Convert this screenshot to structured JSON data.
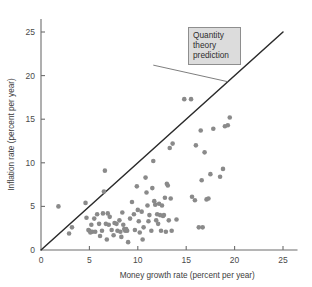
{
  "chart_data": {
    "type": "scatter",
    "title": "",
    "xlabel": "Money growth rate (percent per year)",
    "ylabel": "Inflation rate (percent per year)",
    "xlim": [
      0,
      26.5
    ],
    "ylim": [
      0,
      26.5
    ],
    "xticks": [
      0,
      5,
      10,
      15,
      20,
      25
    ],
    "yticks": [
      0,
      5,
      10,
      15,
      20,
      25
    ],
    "xticklabels": [
      "0",
      "5",
      "10",
      "15",
      "20",
      "25"
    ],
    "yticklabels": [
      "0",
      "5",
      "10",
      "15",
      "20",
      "25"
    ],
    "grid": false,
    "legend": false,
    "point_color": "#8a8a8a",
    "point_radius": 2.3,
    "reference_line": {
      "name": "Quantity theory prediction",
      "slope": 1,
      "intercept": 0,
      "x_start": 0,
      "x_end": 25,
      "color": "#2b2b2b"
    },
    "annotation": {
      "lines": [
        "Quantity",
        "theory",
        "prediction"
      ],
      "box_fill": "#dcdcdc",
      "box_border": "#8e8e8e",
      "leader_from_x": 11.6,
      "leader_from_y": 21.2,
      "leader_to_x": 19.3,
      "leader_to_y": 19.3
    },
    "points": [
      [
        1.8,
        5.0
      ],
      [
        2.9,
        1.9
      ],
      [
        3.2,
        2.6
      ],
      [
        4.6,
        5.4
      ],
      [
        4.7,
        3.7
      ],
      [
        4.9,
        2.3
      ],
      [
        5.0,
        2.2
      ],
      [
        5.1,
        2.0
      ],
      [
        5.2,
        2.9
      ],
      [
        5.3,
        2.1
      ],
      [
        5.5,
        3.6
      ],
      [
        5.6,
        2.1
      ],
      [
        5.8,
        4.1
      ],
      [
        6.0,
        3.0
      ],
      [
        6.1,
        1.6
      ],
      [
        6.3,
        2.2
      ],
      [
        6.4,
        4.2
      ],
      [
        6.5,
        6.7
      ],
      [
        6.6,
        9.1
      ],
      [
        6.7,
        3.0
      ],
      [
        6.8,
        1.2
      ],
      [
        6.9,
        4.2
      ],
      [
        7.0,
        2.9
      ],
      [
        7.1,
        3.8
      ],
      [
        7.3,
        2.3
      ],
      [
        7.5,
        1.7
      ],
      [
        7.6,
        3.1
      ],
      [
        7.8,
        3.0
      ],
      [
        7.9,
        2.2
      ],
      [
        8.1,
        3.4
      ],
      [
        8.2,
        2.1
      ],
      [
        8.3,
        1.5
      ],
      [
        8.4,
        4.3
      ],
      [
        8.5,
        2.9
      ],
      [
        8.6,
        2.4
      ],
      [
        8.7,
        2.2
      ],
      [
        8.8,
        2.4
      ],
      [
        8.9,
        2.2
      ],
      [
        9.0,
        0.9
      ],
      [
        9.2,
        3.6
      ],
      [
        9.4,
        5.5
      ],
      [
        9.6,
        4.1
      ],
      [
        9.7,
        2.3
      ],
      [
        9.9,
        7.3
      ],
      [
        10.0,
        4.6
      ],
      [
        10.1,
        3.3
      ],
      [
        10.2,
        2.0
      ],
      [
        10.4,
        4.4
      ],
      [
        10.5,
        1.2
      ],
      [
        10.6,
        2.6
      ],
      [
        10.8,
        8.3
      ],
      [
        10.9,
        6.6
      ],
      [
        11.0,
        5.1
      ],
      [
        11.1,
        3.3
      ],
      [
        11.2,
        4.0
      ],
      [
        11.4,
        2.2
      ],
      [
        11.5,
        7.1
      ],
      [
        11.6,
        10.2
      ],
      [
        11.7,
        5.6
      ],
      [
        11.8,
        5.2
      ],
      [
        11.9,
        3.4
      ],
      [
        12.0,
        4.1
      ],
      [
        12.1,
        3.0
      ],
      [
        12.2,
        5.3
      ],
      [
        12.3,
        4.0
      ],
      [
        12.4,
        2.2
      ],
      [
        12.5,
        5.1
      ],
      [
        12.6,
        3.9
      ],
      [
        12.7,
        4.0
      ],
      [
        12.8,
        6.0
      ],
      [
        12.9,
        2.1
      ],
      [
        13.0,
        7.6
      ],
      [
        13.1,
        7.4
      ],
      [
        13.2,
        3.4
      ],
      [
        13.3,
        11.7
      ],
      [
        13.4,
        5.9
      ],
      [
        13.5,
        2.2
      ],
      [
        13.6,
        12.2
      ],
      [
        14.0,
        3.5
      ],
      [
        14.8,
        17.3
      ],
      [
        15.5,
        17.3
      ],
      [
        15.6,
        6.1
      ],
      [
        15.9,
        5.7
      ],
      [
        16.0,
        12.0
      ],
      [
        16.3,
        2.6
      ],
      [
        16.5,
        13.7
      ],
      [
        16.6,
        8.0
      ],
      [
        16.7,
        2.6
      ],
      [
        16.9,
        11.2
      ],
      [
        17.1,
        5.8
      ],
      [
        17.3,
        5.9
      ],
      [
        17.5,
        8.7
      ],
      [
        17.8,
        13.9
      ],
      [
        18.5,
        8.4
      ],
      [
        18.8,
        9.3
      ],
      [
        19.0,
        14.2
      ],
      [
        19.3,
        14.3
      ],
      [
        19.5,
        15.2
      ]
    ]
  }
}
